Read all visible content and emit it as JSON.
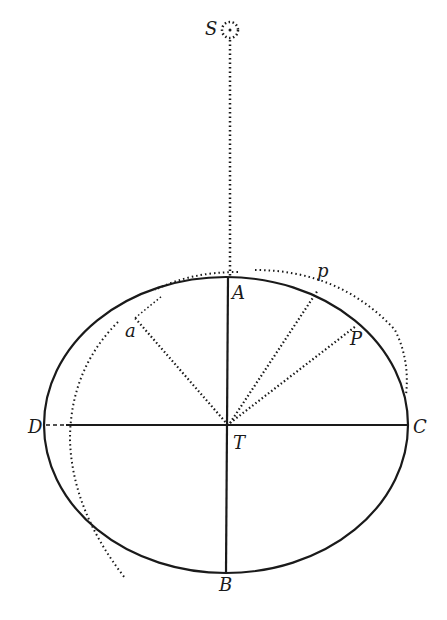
{
  "labels": {
    "S": "S",
    "A": "A",
    "B": "B",
    "C": "C",
    "D": "D",
    "T": "T",
    "P": "P",
    "p": "p",
    "a": "a"
  },
  "colors": {
    "ink": "#1a1a1a",
    "paper": "#ffffff"
  }
}
